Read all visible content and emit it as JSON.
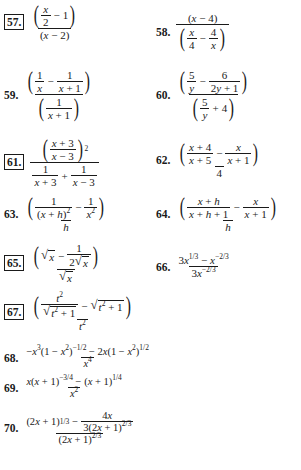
{
  "page": {
    "type": "textbook exercise list",
    "topic": "Simplify complex fractions / algebraic expressions",
    "problems": [
      {
        "number": "57.",
        "boxed": true,
        "expression": "(x/2 − 1) / (x − 2)"
      },
      {
        "number": "58.",
        "boxed": false,
        "expression": "(x − 4) / (x/4 − 4/x)"
      },
      {
        "number": "59.",
        "boxed": false,
        "expression": "(1/x − 1/(x + 1)) / (1/(x + 1))"
      },
      {
        "number": "60.",
        "boxed": false,
        "expression": "(5/y − 6/(2y + 1)) / (5/y + 4)"
      },
      {
        "number": "61.",
        "boxed": true,
        "expression": "((x + 3)/(x − 3))^2 / (1/(x + 3) + 1/(x − 3))"
      },
      {
        "number": "62.",
        "boxed": false,
        "expression": "((x + 4)/(x + 5) − x/(x + 1)) / 4"
      },
      {
        "number": "63.",
        "boxed": false,
        "expression": "(1/(x + h)^2 − 1/x^2) / h"
      },
      {
        "number": "64.",
        "boxed": false,
        "expression": "((x + h)/(x + h + 1) − x/(x + 1)) / h"
      },
      {
        "number": "65.",
        "boxed": true,
        "expression": "(√x − 1/(2√x)) / √x"
      },
      {
        "number": "66.",
        "boxed": false,
        "expression": "(3x^(1/3) − x^(−2/3)) / (3x^(−2/3))"
      },
      {
        "number": "67.",
        "boxed": true,
        "expression": "(t^2/√(t^2 + 1) − √(t^2 + 1)) / t^2"
      },
      {
        "number": "68.",
        "boxed": false,
        "expression": "(−x^3(1 − x^2)^(−1/2) − 2x(1 − x^2)^(1/2)) / x^4"
      },
      {
        "number": "69.",
        "boxed": false,
        "expression": "(x(x + 1)^(−3/4) − (x + 1)^(1/4)) / x^2"
      },
      {
        "number": "70.",
        "boxed": false,
        "expression": "((2x + 1)^(1/3) − 4x/(3(2x + 1)^(2/3))) / (2x + 1)^(2/3)"
      }
    ]
  },
  "labels": {
    "p57": "57.",
    "p58": "58.",
    "p59": "59.",
    "p60": "60.",
    "p61": "61.",
    "p62": "62.",
    "p63": "63.",
    "p64": "64.",
    "p65": "65.",
    "p66": "66.",
    "p67": "67.",
    "p68": "68.",
    "p69": "69.",
    "p70": "70."
  }
}
